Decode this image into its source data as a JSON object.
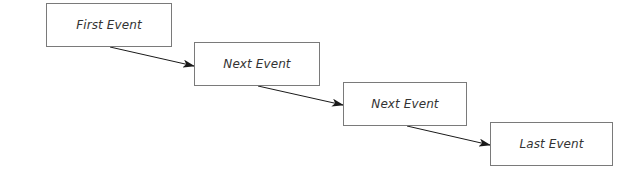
{
  "diagram": {
    "type": "sequence-flow",
    "colors": {
      "background": "#ffffff",
      "box_border": "#7a7a7a",
      "text": "#333333",
      "arrow": "#1a1a1a"
    },
    "events": [
      {
        "label": "First Event",
        "x": 46,
        "y": 3,
        "w": 126,
        "h": 44
      },
      {
        "label": "Next Event",
        "x": 194,
        "y": 42,
        "w": 126,
        "h": 44
      },
      {
        "label": "Next Event",
        "x": 343,
        "y": 82,
        "w": 124,
        "h": 44
      },
      {
        "label": "Last Event",
        "x": 490,
        "y": 122,
        "w": 123,
        "h": 44
      }
    ],
    "arrows": [
      {
        "from": 0,
        "to": 1,
        "x1": 110,
        "y1": 47,
        "x2": 194,
        "y2": 66
      },
      {
        "from": 1,
        "to": 2,
        "x1": 258,
        "y1": 86,
        "x2": 343,
        "y2": 105
      },
      {
        "from": 2,
        "to": 3,
        "x1": 407,
        "y1": 126,
        "x2": 490,
        "y2": 145
      }
    ]
  }
}
